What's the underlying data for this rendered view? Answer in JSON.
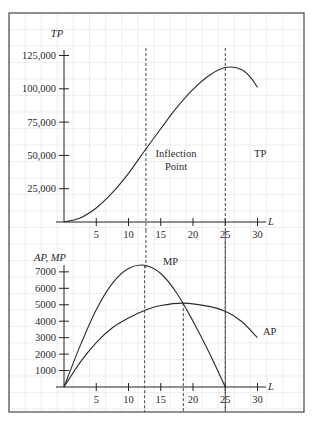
{
  "chart_data": [
    {
      "type": "line",
      "title": "Total Product",
      "xlabel": "L",
      "ylabel": "TP",
      "xlim": [
        0,
        31
      ],
      "ylim": [
        0,
        130000
      ],
      "xticks": [
        5,
        10,
        15,
        20,
        25,
        30
      ],
      "yticks": [
        25000,
        50000,
        75000,
        100000,
        125000
      ],
      "ytick_labels": [
        "25,000",
        "50,000",
        "75,000",
        "100,000",
        "125,000"
      ],
      "grid": true,
      "series": [
        {
          "name": "TP",
          "x": [
            0,
            2.5,
            5,
            7.5,
            10,
            12.5,
            15,
            17.5,
            20,
            22.5,
            25,
            27.5,
            29,
            30
          ],
          "values": [
            0,
            3000,
            10500,
            22000,
            36500,
            53500,
            70000,
            86000,
            99500,
            110000,
            116000,
            114500,
            108000,
            101000
          ]
        }
      ],
      "annotations": [
        {
          "type": "vline",
          "x": 12.7,
          "label": "Inflection Point",
          "style": "dashed"
        },
        {
          "type": "vline",
          "x": 25,
          "label": "",
          "style": "dashed"
        },
        {
          "type": "label",
          "text": "TP",
          "x": 31,
          "y": 91000
        }
      ]
    },
    {
      "type": "line",
      "title": "Average and Marginal Product",
      "xlabel": "L",
      "ylabel": "AP, MP",
      "xlim": [
        0,
        31
      ],
      "ylim": [
        0,
        8000
      ],
      "xticks": [
        5,
        10,
        15,
        20,
        25,
        30
      ],
      "yticks": [
        1000,
        2000,
        3000,
        4000,
        5000,
        6000,
        7000
      ],
      "ytick_labels": [
        "1000",
        "2000",
        "3000",
        "4000",
        "5000",
        "6000",
        "7000"
      ],
      "grid": true,
      "series": [
        {
          "name": "MP",
          "x": [
            0,
            2.5,
            5,
            7.5,
            10,
            12.5,
            15,
            17.5,
            20,
            22.5,
            25
          ],
          "values": [
            0,
            2500,
            4700,
            6300,
            7200,
            7400,
            6900,
            5700,
            4000,
            2100,
            0
          ]
        },
        {
          "name": "AP",
          "x": [
            0,
            2.5,
            5,
            7.5,
            10,
            12.5,
            15,
            18.5,
            22.5,
            25,
            27.5,
            30
          ],
          "values": [
            0,
            1500,
            2700,
            3600,
            4200,
            4650,
            4950,
            5100,
            4900,
            4600,
            4000,
            3000
          ]
        }
      ],
      "annotations": [
        {
          "type": "vline",
          "x": 12.5,
          "style": "dashed",
          "note": "MP maximum"
        },
        {
          "type": "vline",
          "x": 18.5,
          "style": "dashed",
          "note": "MP = AP (AP maximum)"
        },
        {
          "type": "vline",
          "x": 25,
          "style": "dashed",
          "note": "MP = 0"
        },
        {
          "type": "label",
          "text": "MP",
          "x": 15,
          "y": 7300
        },
        {
          "type": "label",
          "text": "AP",
          "x": 31.5,
          "y": 3500
        }
      ]
    }
  ],
  "labels": {
    "top_ylabel": "TP",
    "top_xlabel": "L",
    "tp_curve_label": "TP",
    "inflection_line1": "Inflection",
    "inflection_line2": "Point",
    "bottom_ylabel": "AP, MP",
    "bottom_xlabel": "L",
    "mp_curve_label": "MP",
    "ap_curve_label": "AP"
  },
  "colors": {
    "frame": "#555555",
    "axis": "#222222",
    "curve": "#2a2a2a",
    "grid": "#e6e6e6",
    "dashed": "#444444"
  }
}
